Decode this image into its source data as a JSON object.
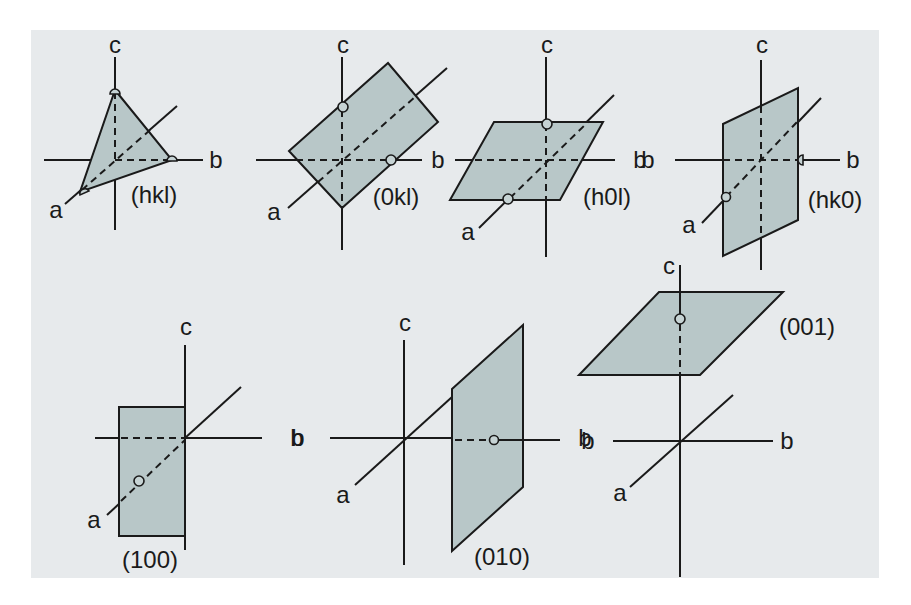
{
  "figure": {
    "colors": {
      "background": "#e7eaec",
      "plane_fill": "#b8c7c8",
      "line": "#1a1a1a"
    },
    "panels": [
      {
        "id": "hkl",
        "plane_label": "(hkl)",
        "axes": {
          "a": "a",
          "b": "b",
          "c": "c"
        }
      },
      {
        "id": "0kl",
        "plane_label": "(0kl)",
        "axes": {
          "a": "a",
          "b": "b",
          "c": "c"
        }
      },
      {
        "id": "h0l",
        "plane_label": "(h0l)",
        "axes": {
          "a": "a",
          "b": "b",
          "c": "c"
        }
      },
      {
        "id": "hk0",
        "plane_label": "(hk0)",
        "axes": {
          "a": "a",
          "b_left": "b",
          "b_right": "b",
          "c": "c"
        }
      },
      {
        "id": "100",
        "plane_label": "(100)",
        "axes": {
          "a": "a",
          "b": "b",
          "c": "c"
        }
      },
      {
        "id": "010",
        "plane_label": "(010)",
        "axes": {
          "a": "a",
          "b_left": "b",
          "b_right": "b",
          "c": "c"
        }
      },
      {
        "id": "001",
        "plane_label": "(001)",
        "axes": {
          "a": "a",
          "b_left": "b",
          "b_right": "b",
          "c": "c"
        }
      }
    ]
  }
}
